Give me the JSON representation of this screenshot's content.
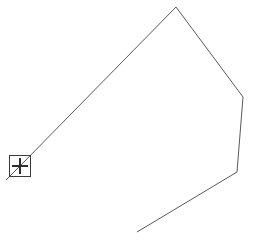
{
  "app": {
    "surface": "drawing-canvas",
    "background_color": "#ffffff"
  },
  "drawing": {
    "stroke_color": "#5a5a5a",
    "stroke_width": 1,
    "shape_type": "polyline",
    "closed": false,
    "vertices": [
      {
        "x": 20,
        "y": 166
      },
      {
        "x": 176,
        "y": 7
      },
      {
        "x": 243,
        "y": 97
      },
      {
        "x": 237,
        "y": 172
      },
      {
        "x": 137,
        "y": 232
      }
    ],
    "path_d": "M 20 166 L 176 7 L 243 97 L 237 172 L 137 232"
  },
  "cursor": {
    "icon": "crosshair-box-cursor",
    "center_x": 20,
    "center_y": 166,
    "box_size": 21,
    "box_color": "#3a3a3a",
    "cross_color": "#2e2e2e",
    "tail": {
      "from_x": 20,
      "from_y": 166,
      "to_x": 6,
      "to_y": 180
    }
  },
  "chart_data": {
    "type": "line",
    "title": "",
    "xlabel": "",
    "ylabel": "",
    "x": [
      20,
      176,
      243,
      237,
      137
    ],
    "values": [
      166,
      7,
      97,
      172,
      232
    ],
    "xlim": [
      0,
      255
    ],
    "ylim": [
      0,
      251
    ],
    "grid": false,
    "legend": "none"
  }
}
